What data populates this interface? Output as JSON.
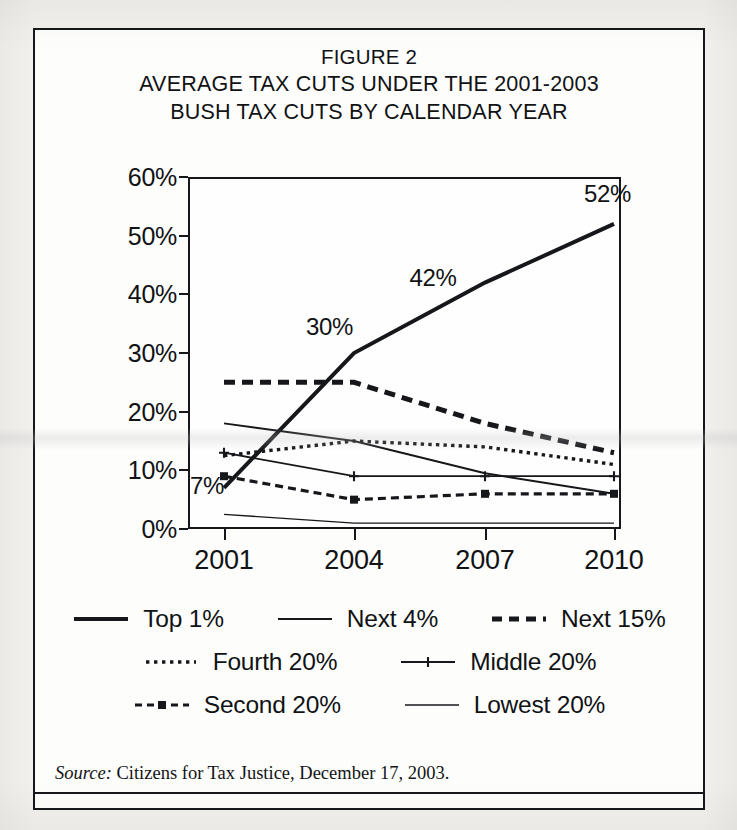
{
  "figure": {
    "title_lines": [
      "FIGURE 2",
      "AVERAGE TAX CUTS UNDER THE 2001-2003",
      "BUSH TAX CUTS BY CALENDAR YEAR"
    ],
    "source_label": "Source:",
    "source_text": " Citizens for Tax Justice, December 17, 2003."
  },
  "axis": {
    "y_ticks": [
      "0%",
      "10%",
      "20%",
      "30%",
      "40%",
      "50%",
      "60%"
    ],
    "x_ticks": [
      "2001",
      "2004",
      "2007",
      "2010"
    ]
  },
  "annotations": [
    {
      "name": "annotation-7pct",
      "text": "7%"
    },
    {
      "name": "annotation-30pct",
      "text": "30%"
    },
    {
      "name": "annotation-42pct",
      "text": "42%"
    },
    {
      "name": "annotation-52pct",
      "text": "52%"
    }
  ],
  "legend": {
    "rows": [
      [
        {
          "label": "Top 1%",
          "style": "thick-solid"
        },
        {
          "label": "Next 4%",
          "style": "thin-solid"
        },
        {
          "label": "Next 15%",
          "style": "thick-dashed"
        }
      ],
      [
        {
          "label": "Fourth 20%",
          "style": "fine-dotted"
        },
        {
          "label": "Middle 20%",
          "style": "cross-marker"
        }
      ],
      [
        {
          "label": "Second 20%",
          "style": "dash-dot-marker"
        },
        {
          "label": "Lowest 20%",
          "style": "hairline"
        }
      ]
    ]
  },
  "colors": {
    "ink": "#15171a",
    "paper": "#fdfdfc",
    "page": "#f2f1ee"
  },
  "chart_data": {
    "type": "line",
    "subtitle": "",
    "xlabel": "",
    "ylabel": "",
    "x": [
      "2001",
      "2004",
      "2007",
      "2010"
    ],
    "categories": [
      "2001",
      "2004",
      "2007",
      "2010"
    ],
    "ylim": [
      0,
      60
    ],
    "xlim": [
      "2001",
      "2010"
    ],
    "y_tick_values": [
      0,
      10,
      20,
      30,
      40,
      50,
      60
    ],
    "y_tick_labels": [
      "0%",
      "10%",
      "20%",
      "30%",
      "40%",
      "50%",
      "60%"
    ],
    "grid": false,
    "legend_position": "below",
    "units": "percent",
    "data_labels": [
      "7%",
      "30%",
      "42%",
      "52%"
    ],
    "series": [
      {
        "name": "Top 1%",
        "values": [
          7,
          30,
          42,
          52
        ],
        "style": "thick-solid"
      },
      {
        "name": "Next 4%",
        "values": [
          18,
          15,
          9.5,
          6
        ],
        "style": "thin-solid"
      },
      {
        "name": "Next 15%",
        "values": [
          25,
          25,
          18,
          13
        ],
        "style": "thick-dashed"
      },
      {
        "name": "Fourth 20%",
        "values": [
          12.5,
          15,
          14,
          11
        ],
        "style": "fine-dotted"
      },
      {
        "name": "Middle 20%",
        "values": [
          13,
          9,
          9,
          9
        ],
        "style": "cross-marker"
      },
      {
        "name": "Second 20%",
        "values": [
          9,
          5,
          6,
          6
        ],
        "style": "dash-dot-marker"
      },
      {
        "name": "Lowest 20%",
        "values": [
          2.5,
          1,
          1,
          1
        ],
        "style": "hairline"
      }
    ]
  }
}
